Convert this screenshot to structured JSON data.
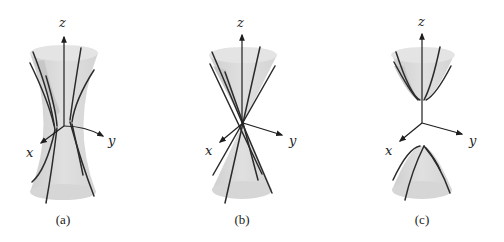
{
  "figure": {
    "panels": [
      {
        "id": "a",
        "caption": "(a)",
        "surface": "hyperboloid of one sheet",
        "axes": {
          "z": "z",
          "x": "x",
          "y": "y"
        }
      },
      {
        "id": "b",
        "caption": "(b)",
        "surface": "double cone",
        "axes": {
          "z": "z",
          "x": "x",
          "y": "y"
        }
      },
      {
        "id": "c",
        "caption": "(c)",
        "surface": "hyperboloid of two sheets",
        "axes": {
          "z": "z",
          "x": "x",
          "y": "y"
        }
      }
    ]
  },
  "colors": {
    "background": "#ffffff",
    "surface_fill": "#d9d9d9",
    "surface_shadow": "#c7c7c7",
    "line": "#2b2b2b"
  }
}
